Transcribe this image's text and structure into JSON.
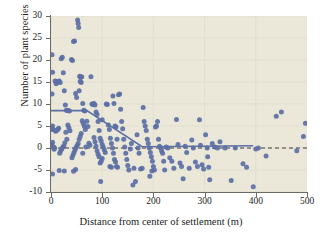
{
  "chart_data": {
    "type": "scatter",
    "title": "",
    "xlabel": "Distance from center of settlement (m)",
    "ylabel": "Number of plant species",
    "xlim": [
      0,
      500
    ],
    "ylim": [
      -10,
      30
    ],
    "xticks": [
      0,
      100,
      200,
      300,
      400,
      500
    ],
    "yticks": [
      -10,
      -5,
      0,
      5,
      10,
      15,
      20,
      25,
      30
    ],
    "grid": "faint",
    "legend": "none",
    "marker_color": "#5b6fa5",
    "background_color": "#ebe8da",
    "points": [
      [
        2,
        21.2
      ],
      [
        3,
        17.2
      ],
      [
        2,
        12.3
      ],
      [
        3,
        5.0
      ],
      [
        2,
        4.3
      ],
      [
        4,
        4.2
      ],
      [
        3,
        1.3
      ],
      [
        2,
        0.6
      ],
      [
        5,
        0.2
      ],
      [
        3,
        -5.9
      ],
      [
        6,
        -0.3
      ],
      [
        8,
        15.2
      ],
      [
        10,
        14.6
      ],
      [
        12,
        15.1
      ],
      [
        14,
        15.0
      ],
      [
        16,
        15.2
      ],
      [
        18,
        14.9
      ],
      [
        20,
        20.3
      ],
      [
        22,
        20.6
      ],
      [
        24,
        17.1
      ],
      [
        26,
        13.0
      ],
      [
        28,
        9.8
      ],
      [
        30,
        8.6
      ],
      [
        32,
        8.5
      ],
      [
        34,
        8.5
      ],
      [
        36,
        8.4
      ],
      [
        33,
        5.2
      ],
      [
        35,
        4.6
      ],
      [
        37,
        3.9
      ],
      [
        29,
        3.6
      ],
      [
        31,
        2.0
      ],
      [
        27,
        1.2
      ],
      [
        25,
        0.4
      ],
      [
        23,
        0.2
      ],
      [
        21,
        -0.2
      ],
      [
        19,
        -0.6
      ],
      [
        17,
        -1.2
      ],
      [
        15,
        4.5
      ],
      [
        13,
        4.2
      ],
      [
        11,
        4.0
      ],
      [
        9,
        3.8
      ],
      [
        7,
        0.0
      ],
      [
        16,
        -5.1
      ],
      [
        26,
        -5.2
      ],
      [
        40,
        20.1
      ],
      [
        42,
        19.9
      ],
      [
        44,
        24.2
      ],
      [
        46,
        24.3
      ],
      [
        48,
        12.4
      ],
      [
        50,
        11.5
      ],
      [
        52,
        29.1
      ],
      [
        53,
        28.3
      ],
      [
        54,
        27.4
      ],
      [
        56,
        16.3
      ],
      [
        58,
        16.0
      ],
      [
        57,
        15.1
      ],
      [
        59,
        14.9
      ],
      [
        55,
        13.0
      ],
      [
        60,
        16.2
      ],
      [
        62,
        10.1
      ],
      [
        64,
        8.6
      ],
      [
        66,
        8.4
      ],
      [
        61,
        6.2
      ],
      [
        63,
        5.6
      ],
      [
        65,
        5.0
      ],
      [
        67,
        4.2
      ],
      [
        59,
        3.3
      ],
      [
        57,
        2.6
      ],
      [
        55,
        2.0
      ],
      [
        53,
        1.0
      ],
      [
        51,
        0.5
      ],
      [
        49,
        0.1
      ],
      [
        47,
        -0.4
      ],
      [
        45,
        -1.0
      ],
      [
        43,
        -1.6
      ],
      [
        41,
        -2.2
      ],
      [
        44,
        -5.3
      ],
      [
        48,
        -4.9
      ],
      [
        62,
        -1.2
      ],
      [
        68,
        0.2
      ],
      [
        70,
        6.1
      ],
      [
        72,
        4.9
      ],
      [
        74,
        1.1
      ],
      [
        76,
        0.6
      ],
      [
        78,
        16.2
      ],
      [
        80,
        10.0
      ],
      [
        82,
        9.9
      ],
      [
        84,
        10.1
      ],
      [
        86,
        9.8
      ],
      [
        88,
        8.2
      ],
      [
        90,
        7.6
      ],
      [
        92,
        6.0
      ],
      [
        94,
        4.0
      ],
      [
        96,
        2.2
      ],
      [
        98,
        1.6
      ],
      [
        100,
        0.8
      ],
      [
        102,
        0.2
      ],
      [
        104,
        -0.4
      ],
      [
        106,
        -1.0
      ],
      [
        100,
        -2.4
      ],
      [
        98,
        -3.0
      ],
      [
        96,
        -3.4
      ],
      [
        94,
        -2.0
      ],
      [
        92,
        -1.4
      ],
      [
        90,
        -0.6
      ],
      [
        88,
        0.4
      ],
      [
        86,
        1.4
      ],
      [
        84,
        2.4
      ],
      [
        100,
        6.4
      ],
      [
        97,
        -7.6
      ],
      [
        108,
        10.0
      ],
      [
        110,
        9.9
      ],
      [
        112,
        5.2
      ],
      [
        114,
        4.2
      ],
      [
        116,
        2.2
      ],
      [
        118,
        1.0
      ],
      [
        120,
        0.0
      ],
      [
        122,
        -1.2
      ],
      [
        124,
        -2.6
      ],
      [
        126,
        -3.2
      ],
      [
        128,
        -4.2
      ],
      [
        130,
        -4.4
      ],
      [
        115,
        -4.2
      ],
      [
        118,
        -4.4
      ],
      [
        121,
        11.8
      ],
      [
        123,
        10.1
      ],
      [
        125,
        5.0
      ],
      [
        127,
        4.8
      ],
      [
        129,
        2.0
      ],
      [
        132,
        12.1
      ],
      [
        134,
        12.3
      ],
      [
        136,
        8.8
      ],
      [
        138,
        6.0
      ],
      [
        140,
        4.4
      ],
      [
        142,
        2.0
      ],
      [
        144,
        0.2
      ],
      [
        146,
        -1.2
      ],
      [
        148,
        -2.6
      ],
      [
        150,
        -4.0
      ],
      [
        152,
        -5.0
      ],
      [
        155,
        -0.2
      ],
      [
        157,
        1.0
      ],
      [
        160,
        -8.4
      ],
      [
        162,
        -4.6
      ],
      [
        165,
        -7.6
      ],
      [
        168,
        3.0
      ],
      [
        170,
        0.0
      ],
      [
        172,
        -1.2
      ],
      [
        175,
        -4.8
      ],
      [
        178,
        -4.6
      ],
      [
        180,
        9.2
      ],
      [
        182,
        6.0
      ],
      [
        184,
        5.0
      ],
      [
        186,
        4.0
      ],
      [
        188,
        2.0
      ],
      [
        190,
        1.0
      ],
      [
        192,
        0.0
      ],
      [
        194,
        -1.0
      ],
      [
        196,
        -2.0
      ],
      [
        198,
        -3.0
      ],
      [
        200,
        -4.2
      ],
      [
        202,
        -5.0
      ],
      [
        197,
        -5.2
      ],
      [
        193,
        -6.4
      ],
      [
        204,
        4.8
      ],
      [
        206,
        5.0
      ],
      [
        208,
        6.0
      ],
      [
        210,
        2.0
      ],
      [
        212,
        0.4
      ],
      [
        214,
        0.0
      ],
      [
        216,
        -0.6
      ],
      [
        218,
        -1.2
      ],
      [
        220,
        -3.0
      ],
      [
        222,
        -5.0
      ],
      [
        225,
        0.2
      ],
      [
        228,
        0.0
      ],
      [
        232,
        -2.2
      ],
      [
        236,
        -3.0
      ],
      [
        240,
        -4.6
      ],
      [
        245,
        6.5
      ],
      [
        248,
        0.8
      ],
      [
        252,
        -3.4
      ],
      [
        255,
        -4.2
      ],
      [
        258,
        -7.0
      ],
      [
        262,
        0.4
      ],
      [
        265,
        -1.0
      ],
      [
        270,
        -4.6
      ],
      [
        275,
        1.8
      ],
      [
        278,
        0.0
      ],
      [
        282,
        -3.2
      ],
      [
        286,
        -4.2
      ],
      [
        290,
        6.4
      ],
      [
        292,
        0.6
      ],
      [
        295,
        -3.8
      ],
      [
        298,
        -4.8
      ],
      [
        302,
        3.0
      ],
      [
        305,
        0.0
      ],
      [
        306,
        -2.0
      ],
      [
        308,
        -4.4
      ],
      [
        310,
        -7.2
      ],
      [
        315,
        1.0
      ],
      [
        320,
        0.2
      ],
      [
        325,
        0.0
      ],
      [
        330,
        1.4
      ],
      [
        340,
        0.0
      ],
      [
        352,
        -7.4
      ],
      [
        360,
        0.0
      ],
      [
        375,
        -3.6
      ],
      [
        382,
        -4.4
      ],
      [
        395,
        -8.8
      ],
      [
        400,
        -0.2
      ],
      [
        405,
        0.0
      ],
      [
        420,
        -1.8
      ],
      [
        440,
        7.2
      ],
      [
        450,
        8.2
      ],
      [
        480,
        -0.6
      ],
      [
        493,
        2.6
      ],
      [
        497,
        5.6
      ]
    ],
    "fitted_curve": {
      "style": "solid",
      "color": "#5b6fa5",
      "points": [
        [
          0,
          8.5
        ],
        [
          70,
          8.5
        ],
        [
          178,
          0.3
        ],
        [
          395,
          0.5
        ]
      ]
    },
    "reference_line": {
      "style": "dashed",
      "color": "#2b2b28",
      "y": 0,
      "x_from": 0,
      "x_to": 500
    }
  }
}
